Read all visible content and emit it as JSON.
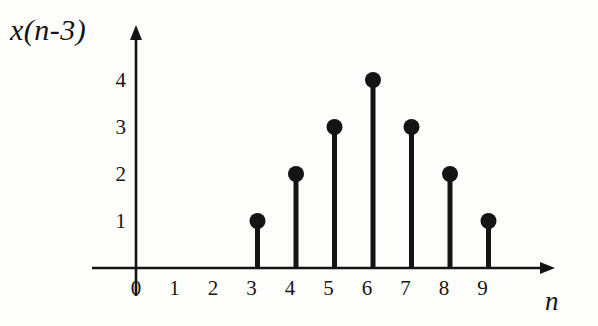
{
  "figure": {
    "background_color": "#fdfdfc",
    "ink_color": "#141414"
  },
  "labels": {
    "y_axis_title": "x(n-3)",
    "x_axis_title": "n"
  },
  "chart_data": {
    "type": "stem",
    "title": "x(n-3)",
    "xlabel": "n",
    "ylabel": "x(n-3)",
    "x": [
      0,
      1,
      2,
      3,
      4,
      5,
      6,
      7,
      8,
      9
    ],
    "values": [
      0,
      0,
      0,
      1,
      2,
      3,
      4,
      3,
      2,
      1
    ],
    "points": [
      {
        "n": 3,
        "value": 1
      },
      {
        "n": 4,
        "value": 2
      },
      {
        "n": 5,
        "value": 3
      },
      {
        "n": 6,
        "value": 4
      },
      {
        "n": 7,
        "value": 3
      },
      {
        "n": 8,
        "value": 2
      },
      {
        "n": 9,
        "value": 1
      }
    ],
    "xtick_labels": [
      "0",
      "1",
      "2",
      "3",
      "4",
      "5",
      "6",
      "7",
      "8",
      "9"
    ],
    "ytick_labels": [
      "1",
      "2",
      "3",
      "4"
    ],
    "xlim": [
      -0.6,
      10.2
    ],
    "ylim": [
      0,
      4.8
    ],
    "grid": false,
    "legend": false,
    "marker": "filled-circle",
    "arrow_axes": true
  },
  "geometry": {
    "origin_x": 136,
    "origin_y": 268,
    "x_step": 38.5,
    "y_step": 47.0,
    "stem_offset": 6,
    "y_axis_top": 40,
    "x_axis_right": 540,
    "marker_radius": 8,
    "stem_width": 5,
    "axis_width": 2.6
  }
}
